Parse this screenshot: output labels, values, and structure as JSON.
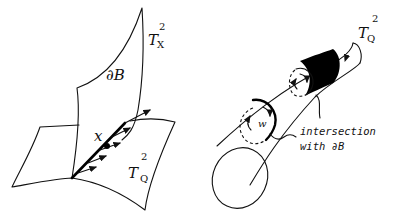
{
  "figure": {
    "left_panel": {
      "surface_upper_label": "T",
      "surface_upper_sup": "2",
      "surface_upper_sub": "X",
      "boundary_label": "∂B",
      "point_label": "x",
      "surface_lower_label": "T",
      "surface_lower_sup": "2",
      "surface_lower_sub": "Q"
    },
    "right_panel": {
      "tube_label": "T",
      "tube_sup": "2",
      "tube_sub": "Q",
      "loop_label": "w",
      "annotation_line1": "intersection",
      "annotation_line2": "with ∂B"
    },
    "colors": {
      "ink": "#111111",
      "background": "#ffffff"
    }
  }
}
